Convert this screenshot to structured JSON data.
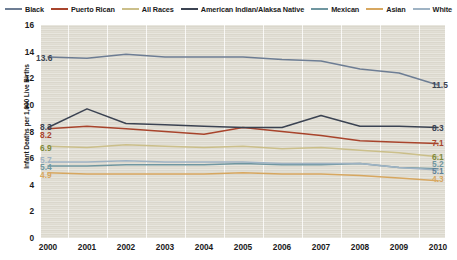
{
  "chart_data": {
    "type": "line",
    "title": "",
    "subtitle": "",
    "xlabel": "",
    "ylabel": "Infant Deaths per 1,000 Live Births",
    "categories": [
      "2000",
      "2001",
      "2002",
      "2003",
      "2004",
      "2005",
      "2006",
      "2007",
      "2008",
      "2009",
      "2010"
    ],
    "xlim": [
      2000,
      2010
    ],
    "ylim": [
      0,
      16
    ],
    "yticks": [
      0,
      2,
      4,
      6,
      8,
      10,
      12,
      14,
      16
    ],
    "grid": "vertical-white-gridlines",
    "legend_position": "top-center",
    "series": [
      {
        "name": "Black",
        "color": "#6d7d94",
        "values": [
          13.6,
          13.5,
          13.8,
          13.6,
          13.6,
          13.6,
          13.4,
          13.3,
          12.7,
          12.4,
          11.5
        ],
        "start_label": "13.6",
        "end_label": "11.5"
      },
      {
        "name": "Puerto Rican",
        "color": "#a8442c",
        "values": [
          8.2,
          8.4,
          8.2,
          8.0,
          7.8,
          8.3,
          8.0,
          7.7,
          7.3,
          7.2,
          7.1
        ],
        "start_label": "8.2",
        "end_label": "7.1"
      },
      {
        "name": "All Races",
        "color": "#cbbf8a",
        "values": [
          6.9,
          6.8,
          7.0,
          6.9,
          6.8,
          6.9,
          6.7,
          6.8,
          6.6,
          6.4,
          6.1
        ],
        "start_label": "6.9",
        "end_label": "6.1"
      },
      {
        "name": "American Indian/Alaksa Native",
        "color": "#3b4352",
        "values": [
          8.3,
          9.7,
          8.6,
          8.5,
          8.4,
          8.3,
          8.3,
          9.2,
          8.4,
          8.4,
          8.3
        ],
        "start_label": "8.3",
        "end_label": "8.3"
      },
      {
        "name": "Mexican",
        "color": "#6f96a0",
        "values": [
          5.4,
          5.4,
          5.5,
          5.5,
          5.5,
          5.6,
          5.5,
          5.5,
          5.6,
          5.3,
          5.2
        ],
        "start_label": "5.4",
        "end_label": "5.2"
      },
      {
        "name": "Asian",
        "color": "#d7a760",
        "values": [
          4.9,
          4.8,
          4.8,
          4.8,
          4.8,
          4.9,
          4.8,
          4.8,
          4.7,
          4.5,
          4.3
        ],
        "start_label": "4.9",
        "end_label": "4.3"
      },
      {
        "name": "White",
        "color": "#9fb3c4",
        "values": [
          5.7,
          5.7,
          5.8,
          5.7,
          5.7,
          5.7,
          5.6,
          5.6,
          5.6,
          5.3,
          5.1
        ],
        "start_label": "5.7",
        "end_label": "5.1"
      }
    ],
    "left_value_labels": [
      {
        "text": "8.3",
        "color": "#3b4352"
      },
      {
        "text": "8.2",
        "color": "#a8442c"
      },
      {
        "text": "6.9",
        "color": "#7f8a3c"
      },
      {
        "text": "5.7",
        "color": "#9fb3c4"
      },
      {
        "text": "5.4",
        "color": "#6f96a0"
      },
      {
        "text": "4.9",
        "color": "#d7a760"
      },
      {
        "text": "13.6",
        "color": "#3b4352"
      }
    ],
    "right_value_labels": [
      {
        "text": "11.5",
        "color": "#3b4352"
      },
      {
        "text": "8.3",
        "color": "#3b4352"
      },
      {
        "text": "7.1",
        "color": "#a8442c"
      },
      {
        "text": "6.1",
        "color": "#7f8a3c"
      },
      {
        "text": "5.2",
        "color": "#6f96a0"
      },
      {
        "text": "5.1",
        "color": "#5f7f96"
      },
      {
        "text": "4.3",
        "color": "#d7a760"
      }
    ]
  },
  "legend": {
    "items": [
      {
        "label": "Black",
        "color": "#6d7d94"
      },
      {
        "label": "Puerto Rican",
        "color": "#a8442c"
      },
      {
        "label": "All Races",
        "color": "#cbbf8a"
      },
      {
        "label": "American Indian/Alaksa Native",
        "color": "#3b4352"
      },
      {
        "label": "Mexican",
        "color": "#6f96a0"
      },
      {
        "label": "Asian",
        "color": "#d7a760"
      },
      {
        "label": "White",
        "color": "#9fb3c4"
      }
    ]
  },
  "yaxis": {
    "title": "Infant Deaths per 1,000 Live Births",
    "ticks": [
      "16",
      "14",
      "12",
      "10",
      "8",
      "6",
      "4",
      "2",
      "0"
    ]
  },
  "xaxis": {
    "ticks": [
      "2000",
      "2001",
      "2002",
      "2003",
      "2004",
      "2005",
      "2006",
      "2007",
      "2008",
      "2009",
      "2010"
    ]
  }
}
